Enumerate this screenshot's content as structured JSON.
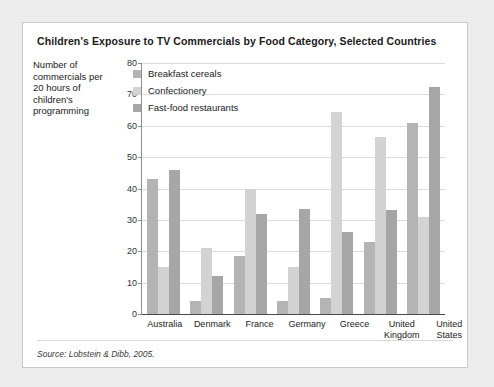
{
  "figure": {
    "title": "Children's Exposure to TV Commercials by Food Category, Selected Countries",
    "y_axis_title": "Number of commercials per 20 hours of children's programming",
    "source_note": "Source: Lobstein & Dibb, 2005."
  },
  "colors": {
    "page_background": "#ececec",
    "card_background": "#ffffff",
    "card_border": "#c9c9c9",
    "gridline": "#dcdcdc",
    "axis": "#4a4a4a",
    "series_breakfast_cereals": "#b4b4b4",
    "series_confectionery": "#d3d3d3",
    "series_fast_food": "#a6a6a6"
  },
  "chart_data": {
    "type": "bar",
    "title": "Children's Exposure to TV Commercials by Food Category, Selected Countries",
    "xlabel": "",
    "ylabel": "Number of commercials per 20 hours of children's programming",
    "ylim": [
      0,
      80
    ],
    "yticks": [
      0,
      10,
      20,
      30,
      40,
      50,
      60,
      70,
      80
    ],
    "grid": true,
    "legend_position": "top-left-inside",
    "categories": [
      "Australia",
      "Denmark",
      "France",
      "Germany",
      "Greece",
      "United Kingdom",
      "United States"
    ],
    "category_lines": [
      [
        "Australia"
      ],
      [
        "Denmark"
      ],
      [
        "France"
      ],
      [
        "Germany"
      ],
      [
        "Greece"
      ],
      [
        "United",
        "Kingdom"
      ],
      [
        "United",
        "States"
      ]
    ],
    "series": [
      {
        "name": "Breakfast cereals",
        "color": "#b4b4b4",
        "values": [
          43,
          4,
          18.5,
          4,
          5,
          23,
          61
        ]
      },
      {
        "name": "Confectionery",
        "color": "#d3d3d3",
        "values": [
          15,
          21,
          40,
          15,
          64.5,
          56.5,
          31
        ]
      },
      {
        "name": "Fast-food restaurants",
        "color": "#a6a6a6",
        "values": [
          46,
          12,
          32,
          33.5,
          26,
          33,
          72.5
        ]
      }
    ]
  }
}
